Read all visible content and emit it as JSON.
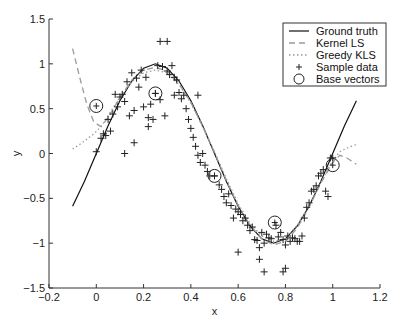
{
  "chart_data": {
    "type": "line",
    "title": "",
    "xlabel": "x",
    "ylabel": "y",
    "xlim": [
      -0.2,
      1.2
    ],
    "ylim": [
      -1.5,
      1.5
    ],
    "xticks": [
      -0.2,
      0,
      0.2,
      0.4,
      0.6,
      0.8,
      1,
      1.2
    ],
    "xtick_labels": [
      "−0.2",
      "0",
      "0.2",
      "0.4",
      "0.6",
      "0.8",
      "1",
      "1.2"
    ],
    "yticks": [
      -1.5,
      -1,
      -0.5,
      0,
      0.5,
      1,
      1.5
    ],
    "ytick_labels": [
      "−1.5",
      "−1",
      "−0.5",
      "0",
      "0.5",
      "1",
      "1.5"
    ],
    "grid": false,
    "legend_position": "top-right",
    "legend": [
      {
        "label": "Ground truth",
        "style": "solid"
      },
      {
        "label": "Kernel LS",
        "style": "dashed"
      },
      {
        "label": "Greedy KLS",
        "style": "dotted"
      },
      {
        "label": "Sample data",
        "style": "plus"
      },
      {
        "label": "Base vectors",
        "style": "circle"
      }
    ],
    "series": [
      {
        "name": "Ground truth",
        "style": "solid",
        "color": "#111111",
        "x": [
          -0.1,
          -0.05,
          0,
          0.05,
          0.1,
          0.15,
          0.2,
          0.25,
          0.3,
          0.35,
          0.4,
          0.45,
          0.5,
          0.55,
          0.6,
          0.65,
          0.7,
          0.75,
          0.8,
          0.85,
          0.9,
          0.95,
          1.0,
          1.05,
          1.1
        ],
        "y": [
          -0.588,
          -0.309,
          0,
          0.309,
          0.588,
          0.809,
          0.951,
          1.0,
          0.951,
          0.809,
          0.588,
          0.309,
          0,
          -0.309,
          -0.588,
          -0.809,
          -0.951,
          -1.0,
          -0.951,
          -0.809,
          -0.588,
          -0.309,
          0,
          0.309,
          0.588
        ]
      },
      {
        "name": "Kernel LS",
        "style": "dashed",
        "color": "#9a9a9a",
        "x": [
          -0.1,
          -0.07,
          -0.04,
          -0.01,
          0.02,
          0.05,
          0.1,
          0.15,
          0.2,
          0.25,
          0.3,
          0.35,
          0.4,
          0.45,
          0.5,
          0.55,
          0.6,
          0.65,
          0.7,
          0.75,
          0.8,
          0.85,
          0.9,
          0.95,
          1.0,
          1.03,
          1.06,
          1.1
        ],
        "y": [
          1.17,
          0.85,
          0.55,
          0.35,
          0.3,
          0.4,
          0.62,
          0.82,
          0.93,
          0.96,
          0.92,
          0.78,
          0.57,
          0.3,
          0.01,
          -0.3,
          -0.58,
          -0.8,
          -0.95,
          -1.02,
          -0.98,
          -0.83,
          -0.6,
          -0.33,
          -0.1,
          -0.02,
          -0.05,
          -0.12
        ]
      },
      {
        "name": "Greedy KLS",
        "style": "dotted",
        "color": "#9a9a9a",
        "x": [
          -0.1,
          -0.07,
          -0.04,
          -0.01,
          0.02,
          0.05,
          0.1,
          0.15,
          0.2,
          0.25,
          0.3,
          0.35,
          0.4,
          0.45,
          0.5,
          0.55,
          0.6,
          0.65,
          0.7,
          0.75,
          0.8,
          0.85,
          0.9,
          0.95,
          1.0,
          1.03,
          1.06,
          1.1
        ],
        "y": [
          0.05,
          0.1,
          0.16,
          0.22,
          0.3,
          0.42,
          0.63,
          0.8,
          0.9,
          0.93,
          0.9,
          0.77,
          0.56,
          0.3,
          0.02,
          -0.28,
          -0.56,
          -0.78,
          -0.92,
          -0.98,
          -0.95,
          -0.8,
          -0.58,
          -0.32,
          -0.08,
          0.02,
          0.06,
          0.1
        ]
      }
    ],
    "sample_data": {
      "x": [
        0.0,
        0.02,
        0.03,
        0.04,
        0.05,
        0.06,
        0.07,
        0.08,
        0.09,
        0.1,
        0.11,
        0.12,
        0.13,
        0.14,
        0.15,
        0.16,
        0.17,
        0.18,
        0.19,
        0.2,
        0.21,
        0.22,
        0.23,
        0.24,
        0.25,
        0.26,
        0.27,
        0.28,
        0.29,
        0.3,
        0.31,
        0.32,
        0.33,
        0.34,
        0.35,
        0.36,
        0.37,
        0.38,
        0.39,
        0.4,
        0.41,
        0.42,
        0.43,
        0.44,
        0.45,
        0.46,
        0.47,
        0.48,
        0.5,
        0.52,
        0.53,
        0.54,
        0.55,
        0.56,
        0.57,
        0.58,
        0.59,
        0.6,
        0.61,
        0.62,
        0.63,
        0.64,
        0.65,
        0.66,
        0.67,
        0.68,
        0.69,
        0.7,
        0.71,
        0.72,
        0.73,
        0.74,
        0.76,
        0.77,
        0.78,
        0.79,
        0.8,
        0.81,
        0.82,
        0.83,
        0.84,
        0.85,
        0.86,
        0.87,
        0.88,
        0.89,
        0.9,
        0.91,
        0.92,
        0.93,
        0.94,
        0.95,
        0.96,
        0.97,
        0.98,
        0.99,
        1.0,
        0.27,
        0.3,
        0.12,
        0.16,
        0.22,
        0.33,
        0.43,
        0.6,
        0.69,
        0.71,
        0.79,
        0.8
      ],
      "y": [
        0.02,
        0.17,
        0.22,
        0.2,
        0.38,
        0.25,
        0.44,
        0.66,
        0.52,
        0.63,
        0.66,
        0.58,
        0.8,
        0.42,
        0.9,
        0.48,
        0.84,
        0.74,
        0.93,
        0.52,
        0.85,
        0.4,
        0.55,
        0.38,
        0.67,
        0.98,
        0.6,
        0.97,
        0.42,
        0.92,
        0.88,
        0.98,
        0.85,
        0.82,
        0.68,
        0.61,
        0.65,
        0.5,
        0.38,
        0.28,
        0.18,
        0.08,
        -0.02,
        -0.1,
        0.0,
        -0.13,
        -0.2,
        -0.25,
        -0.25,
        -0.35,
        -0.4,
        -0.48,
        -0.55,
        -0.45,
        -0.58,
        -0.72,
        -0.62,
        -0.65,
        -0.68,
        -0.75,
        -0.72,
        -0.8,
        -0.86,
        -0.82,
        -0.96,
        -0.97,
        -1.05,
        -0.88,
        -1.0,
        -0.9,
        -0.94,
        -0.95,
        -0.8,
        -0.93,
        -0.88,
        -0.96,
        -1.02,
        -0.92,
        -0.98,
        -0.94,
        -0.95,
        -0.98,
        -0.98,
        -0.92,
        -0.72,
        -0.6,
        -0.55,
        -0.42,
        -0.4,
        -0.36,
        -0.25,
        -0.22,
        -0.18,
        -0.42,
        -0.48,
        -0.05,
        -0.05,
        1.25,
        1.25,
        0.0,
        0.12,
        0.3,
        0.65,
        0.65,
        -1.1,
        -1.18,
        -1.32,
        -1.32,
        -1.28
      ]
    },
    "base_vectors": {
      "x": [
        0.0,
        0.25,
        0.5,
        0.755,
        1.0
      ],
      "y": [
        0.53,
        0.67,
        -0.25,
        -0.77,
        -0.13
      ]
    }
  }
}
